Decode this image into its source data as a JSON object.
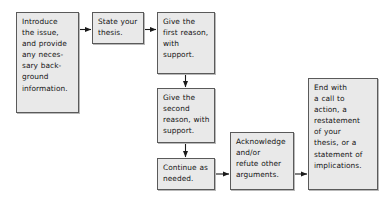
{
  "diagram": {
    "type": "flowchart",
    "colors": {
      "box_fill": "#e9e9e9",
      "box_border": "#5a5a5a",
      "box_shadow": "#b9b9b9",
      "text": "#141414",
      "arrow": "#1a1a1a",
      "background": "#ffffff"
    },
    "nodes": [
      {
        "id": "introduce",
        "text": "Introduce\nthe issue,\nand provide\nany neces-\nsary back-\nground\ninformation."
      },
      {
        "id": "thesis",
        "text": "State your\nthesis."
      },
      {
        "id": "first_reason",
        "text": "Give the\nfirst reason,\nwith\nsupport."
      },
      {
        "id": "second_reason",
        "text": "Give the\nsecond\nreason, with\nsupport."
      },
      {
        "id": "continue",
        "text": "Continue as\nneeded."
      },
      {
        "id": "acknowledge",
        "text": "Acknowledge\nand/or\nrefute other\narguments."
      },
      {
        "id": "end",
        "text": "End with\na call to\naction, a\nrestatement\nof your\nthesis, or a\nstatement of\nimplications."
      }
    ],
    "edges": [
      {
        "id": "e1",
        "from": "introduce",
        "to": "thesis",
        "direction": "right"
      },
      {
        "id": "e2",
        "from": "thesis",
        "to": "first_reason",
        "direction": "right"
      },
      {
        "id": "e3",
        "from": "first_reason",
        "to": "second_reason",
        "direction": "down"
      },
      {
        "id": "e4",
        "from": "second_reason",
        "to": "continue",
        "direction": "down"
      },
      {
        "id": "e5",
        "from": "continue",
        "to": "acknowledge",
        "direction": "right"
      },
      {
        "id": "e6",
        "from": "acknowledge",
        "to": "end",
        "direction": "right"
      }
    ]
  }
}
